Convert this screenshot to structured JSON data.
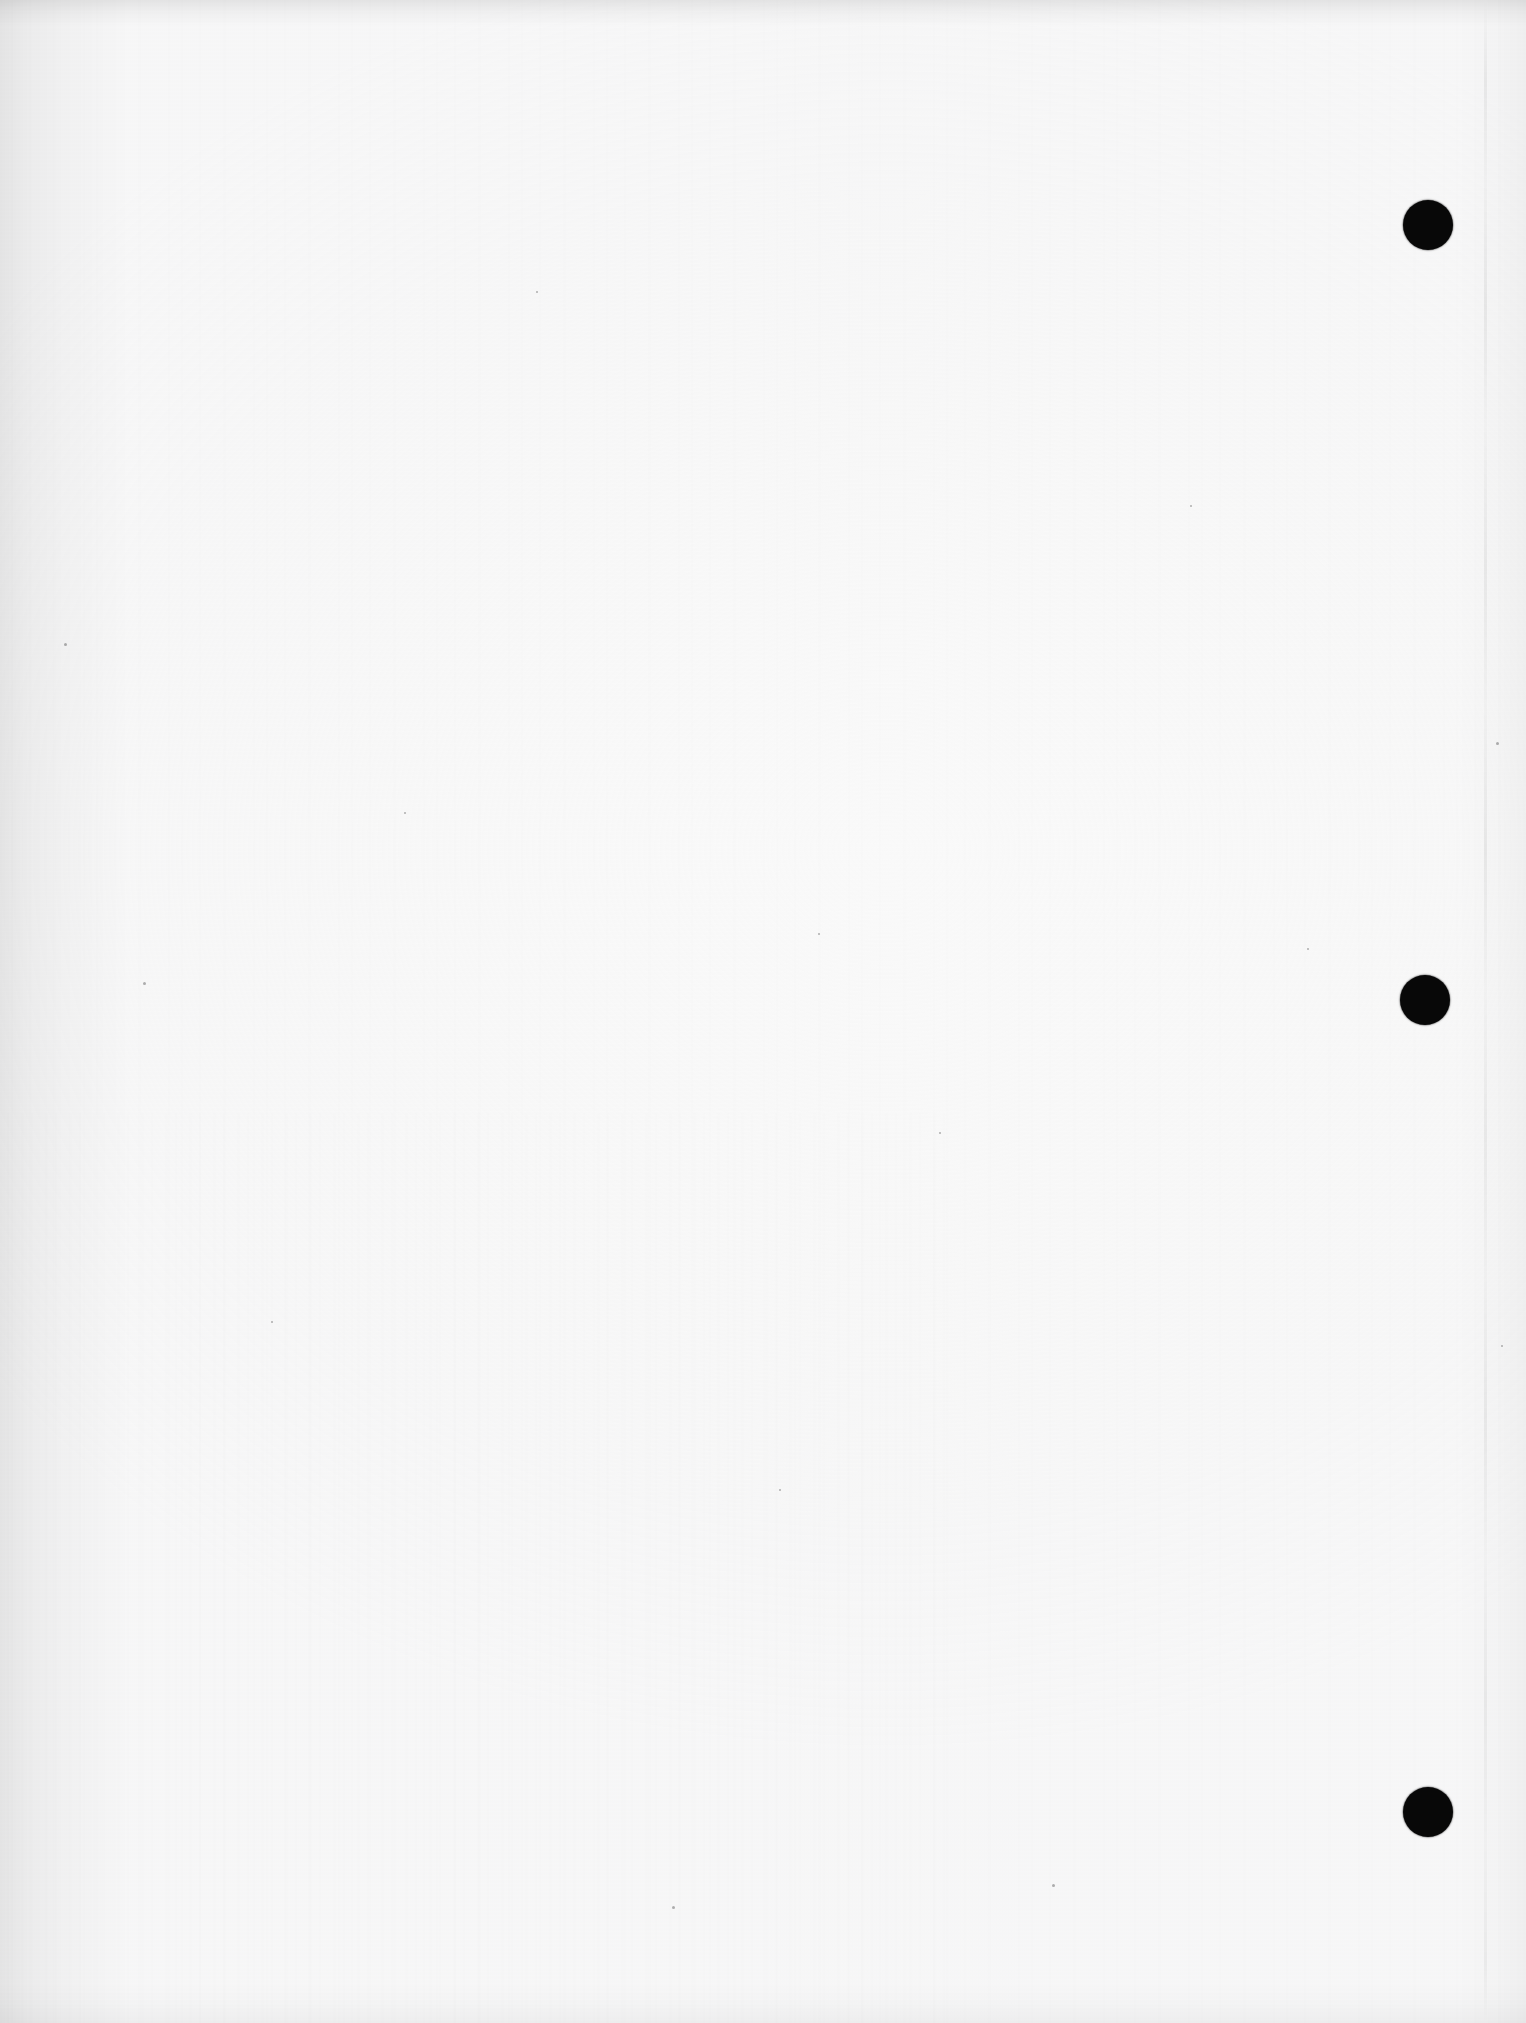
{
  "document": {
    "kind": "scanned-page",
    "page_description": "Blank scanned sheet of paper",
    "visible_text": "",
    "page_width_px": 1526,
    "page_height_px": 2023,
    "orientation": "portrait",
    "background_color": "#fbfbfb",
    "ink_color": "#080808",
    "edge_shadow_color": "#000000"
  },
  "artifacts": {
    "punch_holes": [
      {
        "name": "punch-hole-top",
        "cx": 1428,
        "cy": 225,
        "d": 50,
        "color": "#080808"
      },
      {
        "name": "punch-hole-middle",
        "cx": 1425,
        "cy": 1000,
        "d": 50,
        "color": "#080808"
      },
      {
        "name": "punch-hole-bottom",
        "cx": 1428,
        "cy": 1812,
        "d": 50,
        "color": "#080808"
      }
    ],
    "crease_line": {
      "name": "vertical-crease-line",
      "x": 1484,
      "description": "faint broken vertical fold/crease line near right margin"
    },
    "specks": [
      {
        "x": 64,
        "y": 643,
        "s": 3
      },
      {
        "x": 143,
        "y": 982,
        "s": 3
      },
      {
        "x": 271,
        "y": 1321,
        "s": 2
      },
      {
        "x": 536,
        "y": 291,
        "s": 2
      },
      {
        "x": 672,
        "y": 1906,
        "s": 3
      },
      {
        "x": 779,
        "y": 1489,
        "s": 2
      },
      {
        "x": 939,
        "y": 1132,
        "s": 2
      },
      {
        "x": 1052,
        "y": 1884,
        "s": 3
      },
      {
        "x": 1190,
        "y": 505,
        "s": 2
      },
      {
        "x": 1496,
        "y": 742,
        "s": 3
      },
      {
        "x": 1501,
        "y": 1345,
        "s": 2
      },
      {
        "x": 404,
        "y": 812,
        "s": 2
      },
      {
        "x": 818,
        "y": 933,
        "s": 2
      },
      {
        "x": 1307,
        "y": 948,
        "s": 2
      }
    ],
    "edge_shading": {
      "left": "dark vignette along left edge",
      "top": "thin dark band along top edge",
      "bottom": "soft band along bottom edge",
      "right": "soft band along right edge"
    }
  }
}
